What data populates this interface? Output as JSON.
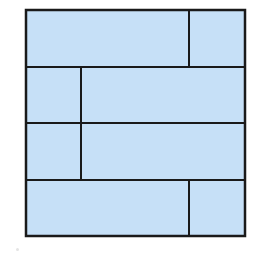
{
  "diagram": {
    "type": "rectangle-partition",
    "fill_color": "#c6e0f7",
    "stroke_color": "#1a1a1a",
    "stroke_width": 2,
    "outer_box": {
      "x": 26,
      "y": 10,
      "width": 219,
      "height": 226
    },
    "rows": [
      {
        "y": 10,
        "height": 57,
        "split_x": 189
      },
      {
        "y": 67,
        "height": 56,
        "split_x": 81
      },
      {
        "y": 123,
        "height": 57,
        "split_x": 81
      },
      {
        "y": 180,
        "height": 56,
        "split_x": 189
      }
    ]
  }
}
